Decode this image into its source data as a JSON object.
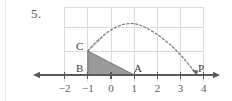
{
  "problem": {
    "number": "5."
  },
  "figure": {
    "points": [
      {
        "name": "C",
        "label": "C",
        "x": -1,
        "y": 1
      },
      {
        "name": "B",
        "label": "B",
        "x": -1,
        "y": 0
      },
      {
        "name": "A",
        "label": "A",
        "x": 1,
        "y": 0
      },
      {
        "name": "P",
        "label": "P",
        "x": 3.7,
        "y": 0
      }
    ],
    "axis": {
      "tick_labels": [
        "−2",
        "−1",
        "0",
        "1",
        "2",
        "3",
        "4"
      ],
      "tick_values": [
        -2,
        -1,
        0,
        1,
        2,
        3,
        4
      ]
    },
    "shapes": {
      "triangle": {
        "name": "triangle-BCA",
        "vertices": [
          [
            -1,
            1
          ],
          [
            -1,
            0
          ],
          [
            1,
            0
          ]
        ],
        "fill": "#9b9b9b",
        "stroke": "#6a6a6a"
      },
      "curve": {
        "name": "dashed-parabola",
        "style": "dashed",
        "color": "#7a7a7a",
        "start": [
          -1,
          1
        ],
        "vertex": [
          1.3,
          2.05
        ],
        "end": [
          3.7,
          0
        ]
      },
      "tangent_ray": {
        "name": "tangent-ray-at-C",
        "color": "#8a8a8a",
        "from": [
          -1,
          1
        ],
        "to": [
          -0.35,
          1.6
        ]
      }
    },
    "colors": {
      "grid": "#dcdcdc",
      "axis": "#5a5a5a",
      "shade": "#9b9b9b"
    }
  }
}
